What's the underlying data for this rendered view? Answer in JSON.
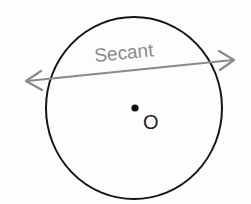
{
  "diagram": {
    "secant_label": "Secant",
    "center_label": "O",
    "colors": {
      "circle": "#151515",
      "secant": "#8a8a8a",
      "secant_text": "#8a8a8a",
      "center_point": "#111111",
      "center_text": "#222222",
      "background": "#fdfdfd"
    },
    "circle": {
      "cx": 134,
      "cy": 108,
      "rx": 88,
      "ry": 91
    },
    "secant_line": {
      "x1": 26,
      "y1": 81,
      "x2": 234,
      "y2": 60
    },
    "center_point": {
      "x": 135,
      "y": 108
    }
  }
}
